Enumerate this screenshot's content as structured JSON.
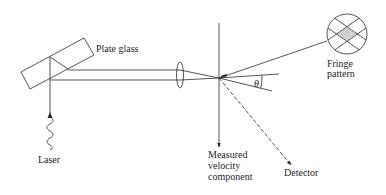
{
  "diagram": {
    "type": "laser-doppler-velocimetry-setup",
    "colors": {
      "line": "#2a2a2a",
      "text": "#1e1e1e",
      "background": "#ffffff",
      "fringe_fill": "#cfcfcf"
    },
    "labels": {
      "plate_glass": "Plate glass",
      "laser": "Laser",
      "fringe_line1": "Fringe",
      "fringe_line2": "pattern",
      "theta": "θ",
      "measured_line1": "Measured",
      "measured_line2": "velocity",
      "measured_line3": "component",
      "detector": "Detector"
    },
    "components": [
      {
        "id": "laser",
        "icon": "wavy-light-icon"
      },
      {
        "id": "plate-glass",
        "icon": "beam-splitter-rectangle"
      },
      {
        "id": "lens",
        "icon": "convex-lens-icon"
      },
      {
        "id": "fringe-pattern",
        "icon": "crosshatched-circle-icon"
      },
      {
        "id": "detector",
        "icon": "dashed-arrow"
      },
      {
        "id": "measured-velocity-component",
        "icon": "vertical-arrow"
      }
    ]
  }
}
